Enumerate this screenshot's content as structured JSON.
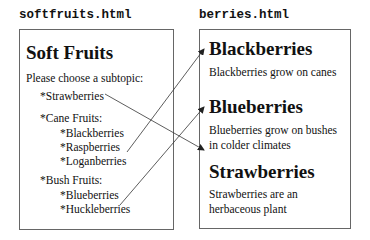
{
  "left_page": {
    "filename": "softfruits.html",
    "title": "Soft Fruits",
    "prompt": "Please choose a subtopic:",
    "items": [
      {
        "label": "*Strawberries",
        "level": 1
      },
      {
        "label": "*Cane Fruits:",
        "level": 1
      },
      {
        "label": "*Blackberries",
        "level": 2
      },
      {
        "label": "*Raspberries",
        "level": 2
      },
      {
        "label": "*Loganberries",
        "level": 2
      },
      {
        "label": "*Bush Fruits:",
        "level": 1
      },
      {
        "label": "*Blueberries",
        "level": 2
      },
      {
        "label": "*Huckleberries",
        "level": 2
      }
    ]
  },
  "right_page": {
    "filename": "berries.html",
    "sections": [
      {
        "title": "Blackberries",
        "text_lines": [
          "Blackberries grow on canes"
        ]
      },
      {
        "title": "Blueberries",
        "text_lines": [
          "Blueberries grow on bushes",
          "in colder climates"
        ]
      },
      {
        "title": "Strawberries",
        "text_lines": [
          "Strawberries are an",
          "herbaceous plant"
        ]
      }
    ]
  },
  "links": [
    {
      "from": "*Strawberries",
      "to": "Strawberries"
    },
    {
      "from": "*Blackberries",
      "to": "Blackberries"
    },
    {
      "from": "*Blueberries",
      "to": "Blueberries"
    }
  ],
  "colors": {
    "line": "#333333",
    "border": "#666666"
  }
}
